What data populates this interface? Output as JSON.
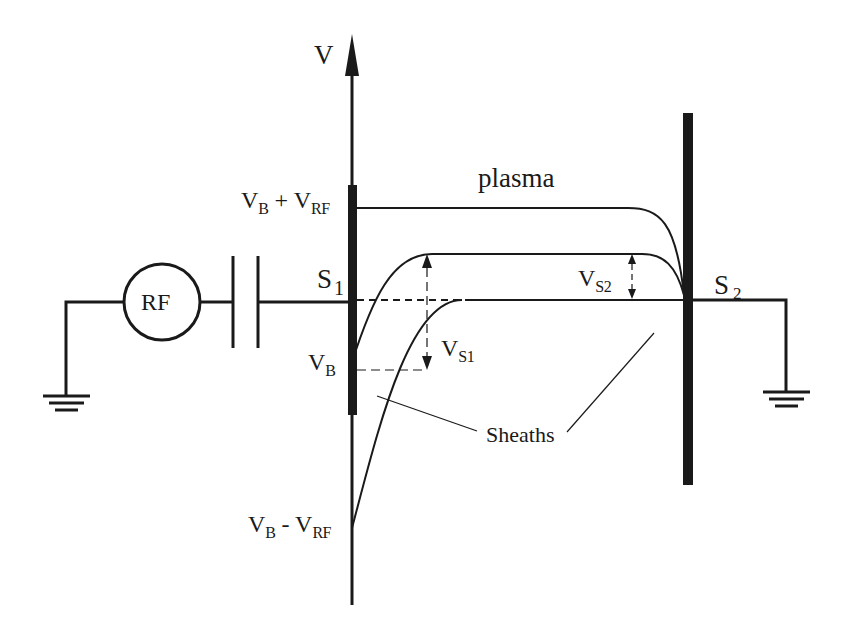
{
  "diagram": {
    "axis_label": "V",
    "source_label": "RF",
    "electrodes": [
      {
        "name": "S",
        "sub": "1"
      },
      {
        "name": "S",
        "sub": "2"
      }
    ],
    "region_label": "plasma",
    "potential_levels": {
      "upper": {
        "base": "V",
        "base_sub": "B",
        "op": " + ",
        "term": "V",
        "term_sub": "RF"
      },
      "bias": {
        "base": "V",
        "base_sub": "B"
      },
      "lower": {
        "base": "V",
        "base_sub": "B",
        "op": " - ",
        "term": "V",
        "term_sub": "RF"
      }
    },
    "sheath_voltages": [
      {
        "base": "V",
        "sub": "S1"
      },
      {
        "base": "V",
        "sub": "S2"
      }
    ],
    "sheath_label": "Sheaths",
    "components": [
      "RF generator",
      "blocking capacitor",
      "ground",
      "ground"
    ],
    "colors": {
      "ink": "#1a1a1a",
      "background": "#ffffff"
    }
  }
}
